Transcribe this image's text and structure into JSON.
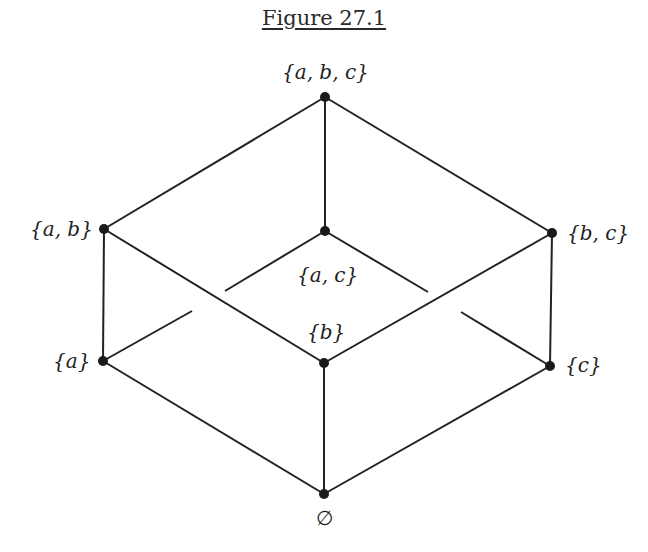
{
  "figure": {
    "title": "Figure 27.1",
    "type": "Hasse diagram (power set lattice of {a, b, c})"
  },
  "nodes": [
    {
      "id": "abc",
      "label": "{a, b, c}",
      "x": 325,
      "y": 97
    },
    {
      "id": "ab",
      "label": "{a, b}",
      "x": 104,
      "y": 229
    },
    {
      "id": "ac",
      "label": "{a, c}",
      "x": 325,
      "y": 231
    },
    {
      "id": "bc",
      "label": "{b, c}",
      "x": 552,
      "y": 233
    },
    {
      "id": "a",
      "label": "{a}",
      "x": 103,
      "y": 361
    },
    {
      "id": "b",
      "label": "{b}",
      "x": 324,
      "y": 363
    },
    {
      "id": "c",
      "label": "{c}",
      "x": 550,
      "y": 366
    },
    {
      "id": "empty",
      "label": "∅",
      "x": 324,
      "y": 494
    }
  ],
  "edges": [
    {
      "from": "abc",
      "to": "ab"
    },
    {
      "from": "abc",
      "to": "ac"
    },
    {
      "from": "abc",
      "to": "bc"
    },
    {
      "from": "ab",
      "to": "a"
    },
    {
      "from": "ab",
      "to": "b"
    },
    {
      "from": "bc",
      "to": "b"
    },
    {
      "from": "bc",
      "to": "c"
    },
    {
      "from": "ac",
      "to": "a",
      "broken": true
    },
    {
      "from": "ac",
      "to": "c",
      "broken": true
    },
    {
      "from": "a",
      "to": "empty"
    },
    {
      "from": "b",
      "to": "empty"
    },
    {
      "from": "c",
      "to": "empty"
    }
  ],
  "labels": {
    "abc": "{a, b, c}",
    "ab": "{a, b}",
    "ac": "{a, c}",
    "bc": "{b, c}",
    "a": "{a}",
    "b": "{b}",
    "c": "{c}",
    "empty": "∅"
  },
  "colors": {
    "line": "#222222",
    "node": "#1a1a1a",
    "background": "#ffffff"
  }
}
